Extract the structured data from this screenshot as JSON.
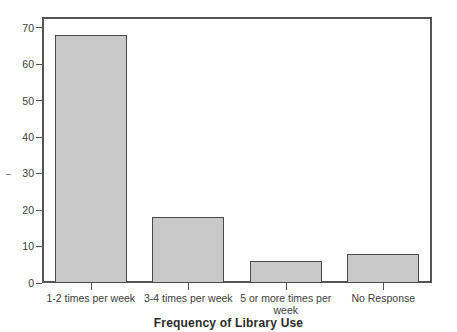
{
  "chart_data": {
    "type": "bar",
    "title": "",
    "xlabel": "Frequency of Library Use",
    "ylabel": "",
    "categories": [
      "1-2 times per week",
      "3-4 times per week",
      "5 or more times per week",
      "No Response"
    ],
    "values": [
      68,
      18,
      6,
      8
    ],
    "ylim": [
      0,
      73
    ],
    "yticks": [
      0,
      10,
      20,
      30,
      40,
      50,
      60,
      70
    ],
    "ytick_labels": [
      "0",
      "10",
      "20",
      "30",
      "40",
      "50",
      "60",
      "70"
    ],
    "grid": false,
    "legend": false,
    "legend_position": "none",
    "bar_fill_color": "#c9c9c9",
    "bar_edge_color": "#4a4a4a",
    "frame_color": "#555555",
    "background_color": "#ffffff"
  },
  "axis_title": "Frequency of Library Use"
}
